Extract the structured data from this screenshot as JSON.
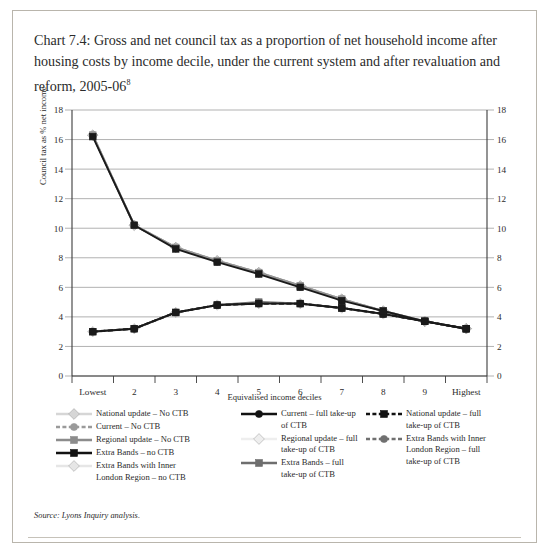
{
  "chart_data": {
    "type": "line",
    "title": "Chart 7.4: Gross and net council tax as a proportion of net household income after housing costs by income decile, under the current system and after revaluation and reform, 2005-06",
    "title_superscript": "8",
    "xlabel": "Equivalised income deciles",
    "ylabel": "Council tax as % net income",
    "categories": [
      "Lowest",
      "2",
      "3",
      "4",
      "5",
      "6",
      "7",
      "8",
      "9",
      "Highest"
    ],
    "ylim": [
      0,
      18
    ],
    "yticks": [
      0,
      2,
      4,
      6,
      8,
      10,
      12,
      14,
      16,
      18
    ],
    "grid": true,
    "right_axis": true,
    "legend_position": "below",
    "series": [
      {
        "name": "National update – No CTB",
        "marker": "diamond",
        "dash": false,
        "color": "#d4d4d4",
        "values": [
          16.3,
          10.2,
          8.7,
          7.8,
          7.0,
          6.1,
          5.2,
          4.4,
          3.7,
          3.2
        ]
      },
      {
        "name": "Current – No CTB",
        "marker": "circle",
        "dash": true,
        "color": "#9a9a9a",
        "values": [
          16.3,
          10.2,
          8.7,
          7.8,
          7.0,
          6.1,
          5.2,
          4.4,
          3.7,
          3.2
        ]
      },
      {
        "name": "Regional update – No CTB",
        "marker": "square",
        "dash": false,
        "color": "#8c8c8c",
        "values": [
          16.3,
          10.2,
          8.7,
          7.8,
          7.0,
          6.1,
          5.2,
          4.4,
          3.7,
          3.2
        ]
      },
      {
        "name": "Extra Bands – no CTB",
        "marker": "square",
        "dash": false,
        "color": "#1a1a1a",
        "values": [
          16.2,
          10.2,
          8.6,
          7.7,
          6.9,
          6.0,
          5.1,
          4.4,
          3.7,
          3.2
        ]
      },
      {
        "name": "Extra Bands with Inner London Region – no CTB",
        "marker": "diamond",
        "dash": false,
        "color": "#e2e2e2",
        "values": [
          16.3,
          10.2,
          8.7,
          7.8,
          7.0,
          6.1,
          5.2,
          4.4,
          3.7,
          3.2
        ]
      },
      {
        "name": "Current – full take-up of CTB",
        "marker": "circle",
        "dash": false,
        "color": "#1a1a1a",
        "values": [
          3.0,
          3.2,
          4.3,
          4.8,
          4.9,
          4.9,
          4.6,
          4.2,
          3.7,
          3.2
        ]
      },
      {
        "name": "Regional update – full take-up of CTB",
        "marker": "diamond",
        "dash": false,
        "color": "#ededed",
        "values": [
          3.0,
          3.2,
          4.3,
          4.8,
          4.9,
          4.9,
          4.6,
          4.2,
          3.7,
          3.2
        ]
      },
      {
        "name": "Extra Bands – full take-up of CTB",
        "marker": "square",
        "dash": false,
        "color": "#6e6e6e",
        "values": [
          3.0,
          3.2,
          4.3,
          4.8,
          5.0,
          4.9,
          4.6,
          4.2,
          3.7,
          3.2
        ]
      },
      {
        "name": "National update – full take-up of CTB",
        "marker": "square",
        "dash": true,
        "color": "#1a1a1a",
        "values": [
          3.0,
          3.2,
          4.3,
          4.8,
          4.9,
          4.9,
          4.6,
          4.2,
          3.7,
          3.2
        ]
      },
      {
        "name": "Extra Bands with Inner London Region – full take-up of CTB",
        "marker": "circle",
        "dash": true,
        "color": "#707070",
        "values": [
          3.0,
          3.2,
          4.3,
          4.8,
          4.9,
          4.9,
          4.6,
          4.2,
          3.7,
          3.2
        ]
      }
    ]
  },
  "legend": {
    "columns": [
      {
        "entries": [
          {
            "label_line1": "National update – No CTB",
            "label_line2": "",
            "color": "#d6d6d6",
            "marker": "diamond",
            "dash": false
          },
          {
            "label_line1": "Current – No CTB",
            "label_line2": "",
            "color": "#9a9a9a",
            "marker": "circle",
            "dash": true
          },
          {
            "label_line1": "Regional update – No CTB",
            "label_line2": "",
            "color": "#8c8c8c",
            "marker": "square",
            "dash": false
          },
          {
            "label_line1": "Extra Bands – no CTB",
            "label_line2": "",
            "color": "#121212",
            "marker": "square",
            "dash": false
          },
          {
            "label_line1": "Extra Bands with Inner",
            "label_line2": "London Region – no CTB",
            "color": "#e6e6e6",
            "marker": "diamond",
            "dash": false
          }
        ]
      },
      {
        "entries": [
          {
            "label_line1": "Current – full take-up",
            "label_line2": "of CTB",
            "color": "#121212",
            "marker": "circle",
            "dash": false
          },
          {
            "label_line1": "Regional update – full",
            "label_line2": "take-up of CTB",
            "color": "#eeeeee",
            "marker": "diamond",
            "dash": false
          },
          {
            "label_line1": "Extra Bands – full",
            "label_line2": "take-up of CTB",
            "color": "#6e6e6e",
            "marker": "square",
            "dash": false
          }
        ]
      },
      {
        "entries": [
          {
            "label_line1": "National update – full",
            "label_line2": "take-up of CTB",
            "color": "#121212",
            "marker": "square",
            "dash": true
          },
          {
            "label_line1": "Extra Bands with Inner",
            "label_line2": "London Region – full",
            "label_line3": "take-up of CTB",
            "color": "#707070",
            "marker": "circle",
            "dash": true
          }
        ]
      }
    ]
  },
  "source": "Source: Lyons Inquiry analysis."
}
